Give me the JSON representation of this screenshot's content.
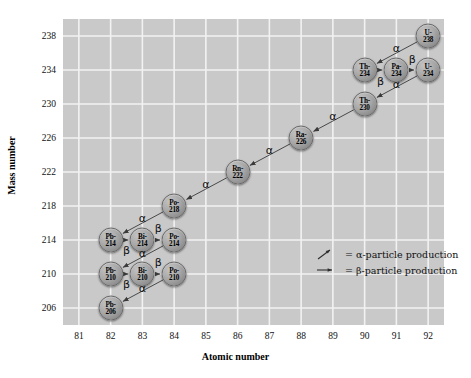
{
  "chart_data": {
    "type": "scatter",
    "title": "",
    "xlabel": "Atomic number",
    "ylabel": "Mass number",
    "xlim": [
      80.5,
      92.5
    ],
    "ylim": [
      204,
      240
    ],
    "xticks": [
      81,
      82,
      83,
      84,
      85,
      86,
      87,
      88,
      89,
      90,
      91,
      92
    ],
    "yticks": [
      206,
      210,
      214,
      218,
      222,
      226,
      230,
      234,
      238
    ],
    "grid": true,
    "legend_position": "center-right",
    "nodes": [
      {
        "id": "U-238",
        "element": "U-",
        "mass": "238",
        "x": 92,
        "y": 238
      },
      {
        "id": "Th-234",
        "element": "Th-",
        "mass": "234",
        "x": 90,
        "y": 234
      },
      {
        "id": "Pa-234",
        "element": "Pa-",
        "mass": "234",
        "x": 91,
        "y": 234
      },
      {
        "id": "U-234",
        "element": "U-",
        "mass": "234",
        "x": 92,
        "y": 234
      },
      {
        "id": "Th-230",
        "element": "Th-",
        "mass": "230",
        "x": 90,
        "y": 230
      },
      {
        "id": "Ra-226",
        "element": "Ra-",
        "mass": "226",
        "x": 88,
        "y": 226
      },
      {
        "id": "Rn-222",
        "element": "Rn-",
        "mass": "222",
        "x": 86,
        "y": 222
      },
      {
        "id": "Po-218",
        "element": "Po-",
        "mass": "218",
        "x": 84,
        "y": 218
      },
      {
        "id": "Pb-214",
        "element": "Pb-",
        "mass": "214",
        "x": 82,
        "y": 214
      },
      {
        "id": "Bi-214",
        "element": "Bi-",
        "mass": "214",
        "x": 83,
        "y": 214
      },
      {
        "id": "Po-214",
        "element": "Po-",
        "mass": "214",
        "x": 84,
        "y": 214
      },
      {
        "id": "Pb-210",
        "element": "Pb-",
        "mass": "210",
        "x": 82,
        "y": 210
      },
      {
        "id": "Bi-210",
        "element": "Bi-",
        "mass": "210",
        "x": 83,
        "y": 210
      },
      {
        "id": "Po-210",
        "element": "Po-",
        "mass": "210",
        "x": 84,
        "y": 210
      },
      {
        "id": "Pb-206",
        "element": "Pb-",
        "mass": "206",
        "x": 82,
        "y": 206
      }
    ],
    "decays": [
      {
        "from": "U-238",
        "to": "Th-234",
        "type": "alpha",
        "label": "α",
        "label_x": 91.0,
        "label_y": 236.6
      },
      {
        "from": "Th-234",
        "to": "Pa-234",
        "type": "beta",
        "label": "β",
        "label_x": 90.5,
        "label_y": 232.7
      },
      {
        "from": "Pa-234",
        "to": "U-234",
        "type": "beta",
        "label": "β",
        "label_x": 91.5,
        "label_y": 235.3
      },
      {
        "from": "U-234",
        "to": "Th-230",
        "type": "alpha",
        "label": "α",
        "label_x": 91.0,
        "label_y": 232.3
      },
      {
        "from": "Th-230",
        "to": "Ra-226",
        "type": "alpha",
        "label": "α",
        "label_x": 89.0,
        "label_y": 228.6
      },
      {
        "from": "Ra-226",
        "to": "Rn-222",
        "type": "alpha",
        "label": "α",
        "label_x": 87.0,
        "label_y": 224.6
      },
      {
        "from": "Rn-222",
        "to": "Po-218",
        "type": "alpha",
        "label": "α",
        "label_x": 85.0,
        "label_y": 220.6
      },
      {
        "from": "Po-218",
        "to": "Pb-214",
        "type": "alpha",
        "label": "α",
        "label_x": 83.0,
        "label_y": 216.6
      },
      {
        "from": "Pb-214",
        "to": "Bi-214",
        "type": "beta",
        "label": "β",
        "label_x": 82.5,
        "label_y": 212.8
      },
      {
        "from": "Bi-214",
        "to": "Po-214",
        "type": "beta",
        "label": "β",
        "label_x": 83.5,
        "label_y": 215.4
      },
      {
        "from": "Po-214",
        "to": "Pb-210",
        "type": "alpha",
        "label": "α",
        "label_x": 83.0,
        "label_y": 212.5
      },
      {
        "from": "Pb-210",
        "to": "Bi-210",
        "type": "beta",
        "label": "β",
        "label_x": 82.5,
        "label_y": 208.8
      },
      {
        "from": "Bi-210",
        "to": "Po-210",
        "type": "beta",
        "label": "β",
        "label_x": 83.5,
        "label_y": 211.4
      },
      {
        "from": "Po-210",
        "to": "Pb-206",
        "type": "alpha",
        "label": "α",
        "label_x": 83.0,
        "label_y": 208.4
      }
    ],
    "legend": [
      {
        "symbol": "diagonal-arrow",
        "text": "= α-particle production"
      },
      {
        "symbol": "horizontal-arrow",
        "text": "= β-particle production"
      }
    ],
    "colors": {
      "panel": "#c9c9c9",
      "gridline": "#f2f2f2",
      "node_fill": "#a8a8a8",
      "node_stroke": "#6a6a6a",
      "arrow": "#3a3a3a",
      "text": "#111111"
    }
  }
}
